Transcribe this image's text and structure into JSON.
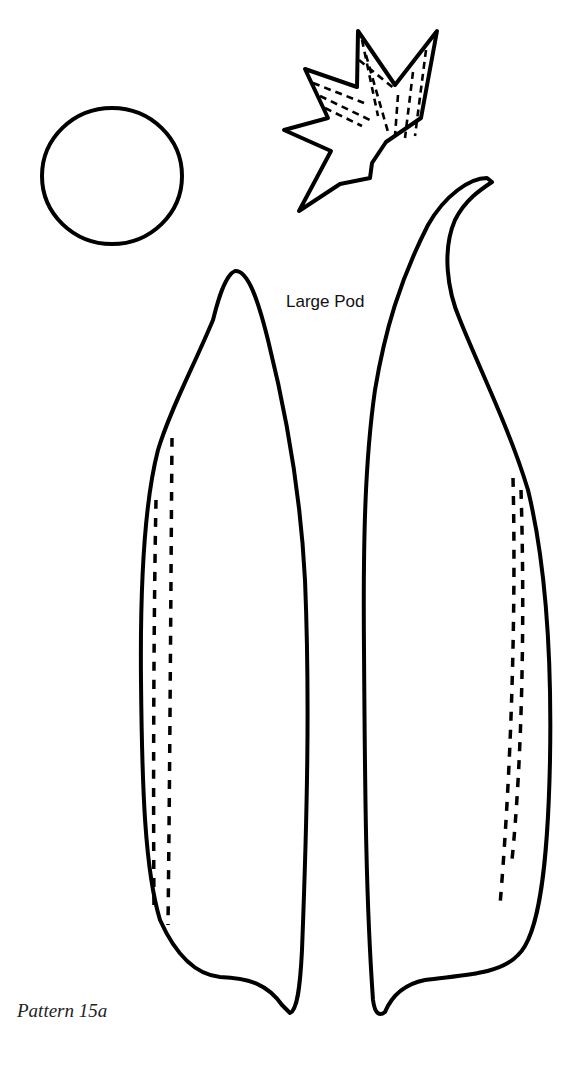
{
  "page": {
    "pattern_label": "Pattern 15a",
    "pieces": [
      {
        "name": "circle",
        "description": "Circle piece"
      },
      {
        "name": "calyx",
        "description": "Star-shaped calyx with dashed stitch lines"
      },
      {
        "name": "large-pod-left",
        "label": "Large Pod",
        "description": "Left pod half with double dashed stitch line"
      },
      {
        "name": "large-pod-right",
        "description": "Right pod half with curled tip and double dashed stitch line"
      }
    ],
    "pod_label": "Large Pod"
  }
}
